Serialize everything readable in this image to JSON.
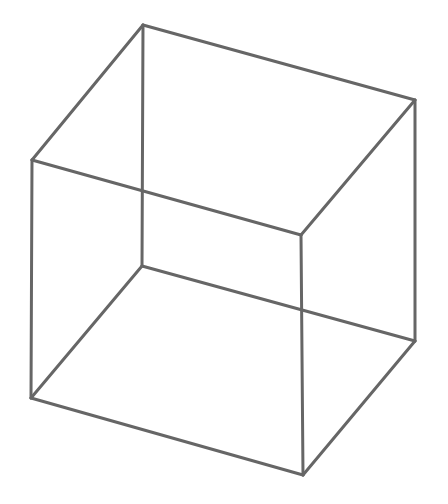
{
  "diagram": {
    "stroke_color": "#666666",
    "stroke_width": 3,
    "background": "#ffffff",
    "vertices": {
      "back_top_left": [
        143,
        25
      ],
      "back_top_right": [
        415,
        100
      ],
      "back_bottom_left": [
        142,
        266
      ],
      "back_bottom_right": [
        415,
        341
      ],
      "front_top_left": [
        32,
        160
      ],
      "front_top_right": [
        301,
        235
      ],
      "front_bottom_left": [
        31,
        398
      ],
      "front_bottom_right": [
        303,
        475
      ]
    },
    "edges": [
      [
        "back_top_left",
        "back_top_right"
      ],
      [
        "back_top_right",
        "back_bottom_right"
      ],
      [
        "back_bottom_right",
        "back_bottom_left"
      ],
      [
        "back_bottom_left",
        "back_top_left"
      ],
      [
        "front_top_left",
        "front_top_right"
      ],
      [
        "front_top_right",
        "front_bottom_right"
      ],
      [
        "front_bottom_right",
        "front_bottom_left"
      ],
      [
        "front_bottom_left",
        "front_top_left"
      ],
      [
        "back_top_left",
        "front_top_left"
      ],
      [
        "back_top_right",
        "front_top_right"
      ],
      [
        "back_bottom_left",
        "front_bottom_left"
      ],
      [
        "back_bottom_right",
        "front_bottom_right"
      ]
    ]
  }
}
